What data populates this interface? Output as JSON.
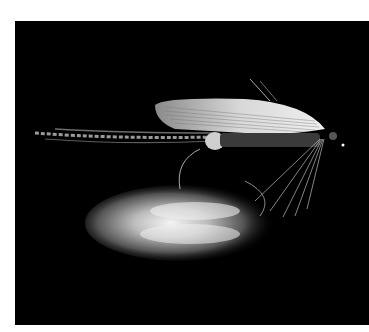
{
  "image": {
    "subject": "Classic wet fishing fly on black background with metallic reflection",
    "alt": "Fishing fly with pale feather wing, speckled tail, hackle fibers and hook, above a silver spoon-like reflection",
    "colors": {
      "background": "#000000",
      "page": "#ffffff",
      "wing": "#d9d9d9",
      "highlight": "#f2f2f2"
    }
  }
}
